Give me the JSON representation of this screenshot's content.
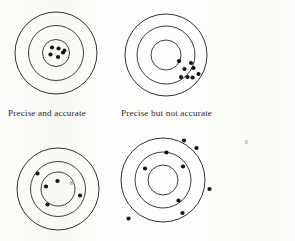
{
  "figure": {
    "background_color": "#fdfdfb",
    "ring_color": "#1b1b1b",
    "shot_color": "#121212",
    "width": 295,
    "height": 241
  },
  "targets": [
    {
      "id": "precise-and-accurate",
      "caption": "Precise and accurate",
      "caption_x": 8,
      "caption_y": 108,
      "center": {
        "x": 56,
        "y": 53
      },
      "radii": {
        "outer": 41,
        "middle": 27.5,
        "inner": 13.5
      },
      "shots": [
        {
          "x": 52.0,
          "y": 47.5,
          "r": 2.1
        },
        {
          "x": 58.5,
          "y": 48.5,
          "r": 2.1
        },
        {
          "x": 63.0,
          "y": 52.5,
          "r": 2.1
        },
        {
          "x": 50.5,
          "y": 54.5,
          "r": 2.1
        },
        {
          "x": 58.0,
          "y": 57.0,
          "r": 2.1
        },
        {
          "x": 64.5,
          "y": 50.5,
          "r": 1.9
        }
      ]
    },
    {
      "id": "precise-but-not-accurate",
      "caption": "Precise but not accurate",
      "caption_x": 121,
      "caption_y": 108,
      "center": {
        "x": 166,
        "y": 55
      },
      "radii": {
        "outer": 41,
        "middle": 29,
        "inner": 15
      },
      "shots": [
        {
          "x": 179.0,
          "y": 61.0,
          "r": 2.1
        },
        {
          "x": 191.0,
          "y": 63.0,
          "r": 2.1
        },
        {
          "x": 184.5,
          "y": 69.0,
          "r": 2.1
        },
        {
          "x": 193.5,
          "y": 68.0,
          "r": 2.1
        },
        {
          "x": 198.5,
          "y": 74.0,
          "r": 2.1
        },
        {
          "x": 181.0,
          "y": 77.0,
          "r": 2.1
        },
        {
          "x": 187.5,
          "y": 77.0,
          "r": 2.1
        },
        {
          "x": 192.5,
          "y": 77.5,
          "r": 2.1
        }
      ]
    },
    {
      "id": "accurate-but-not-precise",
      "caption": "",
      "caption_x": 8,
      "caption_y": 236,
      "center": {
        "x": 58,
        "y": 189
      },
      "radii": {
        "outer": 41,
        "middle": 27.5,
        "inner": 17
      },
      "shots": [
        {
          "x": 37.5,
          "y": 173.5,
          "r": 2.1
        },
        {
          "x": 57.5,
          "y": 181.0,
          "r": 2.1
        },
        {
          "x": 46.0,
          "y": 186.5,
          "r": 2.1
        },
        {
          "x": 80.0,
          "y": 195.5,
          "r": 2.1
        },
        {
          "x": 47.5,
          "y": 204.5,
          "r": 2.1
        },
        {
          "x": 71.5,
          "y": 183.0,
          "r": 2.0,
          "faded": true
        }
      ]
    },
    {
      "id": "neither-precise-nor-accurate",
      "caption": "",
      "caption_x": 121,
      "caption_y": 236,
      "center": {
        "x": 163,
        "y": 180
      },
      "radii": {
        "outer": 42,
        "middle": 28,
        "inner": 15
      },
      "shots": [
        {
          "x": 184.0,
          "y": 140.5,
          "r": 2.1
        },
        {
          "x": 196.5,
          "y": 148.0,
          "r": 2.1
        },
        {
          "x": 166.5,
          "y": 152.5,
          "r": 2.1
        },
        {
          "x": 145.0,
          "y": 168.5,
          "r": 2.1
        },
        {
          "x": 183.0,
          "y": 166.5,
          "r": 2.1
        },
        {
          "x": 209.5,
          "y": 189.0,
          "r": 2.1
        },
        {
          "x": 178.5,
          "y": 200.5,
          "r": 2.1
        },
        {
          "x": 182.5,
          "y": 213.0,
          "r": 2.1
        },
        {
          "x": 128.5,
          "y": 218.5,
          "r": 2.1
        }
      ]
    }
  ],
  "artifacts": [
    {
      "x": 245,
      "y": 140,
      "w": 3,
      "h": 4
    }
  ]
}
